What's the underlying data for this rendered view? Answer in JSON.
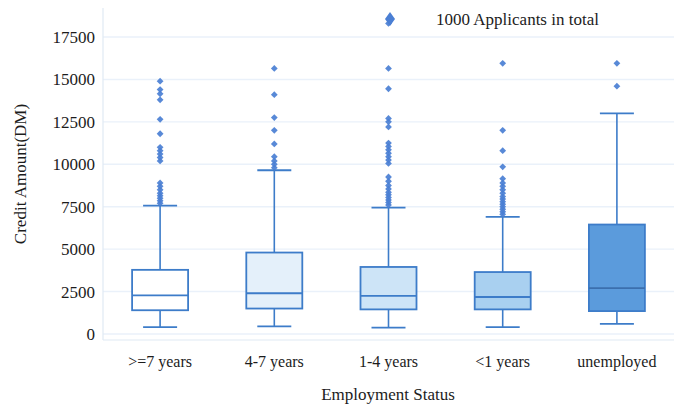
{
  "chart_data": {
    "type": "box",
    "title": "",
    "xlabel": "Employment Status",
    "ylabel": "Credit Amount(DM)",
    "categories": [
      ">=7 years",
      "4-7 years",
      "1-4 years",
      "<1 years",
      "unemployed"
    ],
    "ylim": [
      0,
      18750
    ],
    "yticks": [
      0,
      2500,
      5000,
      7500,
      10000,
      12500,
      15000,
      17500
    ],
    "ytick_labels": [
      "0",
      "2500",
      "5000",
      "7500",
      "10000",
      "12500",
      "15000",
      "17500"
    ],
    "grid": true,
    "legend": {
      "position": "top-right",
      "entries": [
        {
          "label": "1000 Applicants in total",
          "marker": "diamond",
          "color": "#4a7fd4"
        }
      ]
    },
    "colors": {
      "line": "#3d7cc9",
      "grid": "#eaf1fa",
      "outlier": "#4a7fd4",
      "box_fills": [
        "#ffffff",
        "#e4f0fa",
        "#cde4f7",
        "#a9d0f0",
        "#5b9bdc"
      ]
    },
    "boxes": [
      {
        "category": ">=7 years",
        "q1": 1400,
        "median": 2280,
        "q3": 3780,
        "whisker_low": 400,
        "whisker_high": 7560,
        "outliers": [
          7700,
          7850,
          8000,
          8150,
          8300,
          8500,
          8700,
          8900,
          10200,
          10400,
          10600,
          10800,
          11000,
          11800,
          12650,
          13800,
          14150,
          14400,
          14900
        ]
      },
      {
        "category": "4-7 years",
        "q1": 1500,
        "median": 2400,
        "q3": 4800,
        "whisker_low": 450,
        "whisker_high": 9650,
        "outliers": [
          9800,
          10000,
          10200,
          10450,
          11200,
          12000,
          12750,
          14100,
          15650
        ]
      },
      {
        "category": "1-4 years",
        "q1": 1450,
        "median": 2250,
        "q3": 3950,
        "whisker_low": 380,
        "whisker_high": 7450,
        "outliers": [
          7600,
          7750,
          7900,
          8050,
          8200,
          8350,
          8550,
          8750,
          9000,
          9250,
          10050,
          10250,
          10450,
          10650,
          10850,
          11050,
          11250,
          12200,
          12500,
          12700,
          14450,
          15650,
          18300
        ]
      },
      {
        "category": "<1 years",
        "q1": 1450,
        "median": 2180,
        "q3": 3650,
        "whisker_low": 400,
        "whisker_high": 6900,
        "outliers": [
          7050,
          7200,
          7350,
          7500,
          7650,
          7800,
          7950,
          8100,
          8300,
          8500,
          8700,
          8900,
          9150,
          9850,
          10800,
          12000,
          15950
        ]
      },
      {
        "category": "unemployed",
        "q1": 1350,
        "median": 2700,
        "q3": 6450,
        "whisker_low": 600,
        "whisker_high": 13000,
        "outliers": [
          14600,
          15950
        ]
      }
    ]
  },
  "geometry": {
    "plot_left": 103,
    "plot_right": 674,
    "plot_top": 8,
    "plot_bottom": 340,
    "y_zero_px": 334,
    "y_per_unit_px": 0.016971
  }
}
